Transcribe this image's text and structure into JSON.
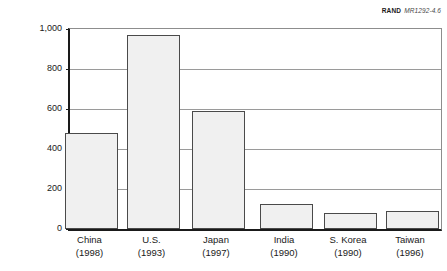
{
  "source": {
    "organization": "RAND",
    "document_id": "MR1292-4.6"
  },
  "chart_data": {
    "type": "bar",
    "title": "",
    "xlabel": "",
    "ylabel": "Number (in thousands)",
    "ylim": [
      0,
      1000
    ],
    "y_ticks": [
      0,
      200,
      400,
      600,
      800,
      1000
    ],
    "y_tick_labels": [
      "0",
      "200",
      "400",
      "600",
      "800",
      "1,000"
    ],
    "grid": true,
    "legend": "none",
    "categories": [
      "China",
      "U.S.",
      "Japan",
      "India",
      "S. Korea",
      "Taiwan"
    ],
    "category_years": [
      "(1998)",
      "(1993)",
      "(1997)",
      "(1990)",
      "(1990)",
      "(1996)"
    ],
    "values": [
      480,
      970,
      590,
      125,
      80,
      90
    ],
    "bar_fill_color": "#f0f0f0",
    "bar_edge_color": "#4a4a4a",
    "axis_color": "#1a1a1a",
    "gridline_color": "#9a9a9a"
  }
}
